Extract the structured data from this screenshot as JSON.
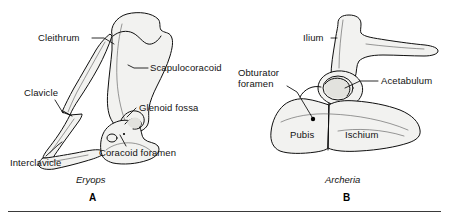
{
  "figure": {
    "ink_color": "#121212",
    "bone_fill": "#f2f2f0",
    "bone_shade": "#e2e2de"
  },
  "panels": [
    {
      "letter": "A",
      "genus": "Eryops",
      "structure": "pectoral girdle",
      "labels": [
        {
          "id": "cleithrum",
          "text": "Cleithrum"
        },
        {
          "id": "scapulocoracoid",
          "text": "Scapulocoracoid"
        },
        {
          "id": "clavicle",
          "text": "Clavicle"
        },
        {
          "id": "glenoid-fossa",
          "text": "Glenoid fossa"
        },
        {
          "id": "coracoid-foramen",
          "text": "Coracoid foramen"
        },
        {
          "id": "interclavicle",
          "text": "Interclavicle"
        }
      ]
    },
    {
      "letter": "B",
      "genus": "Archeria",
      "structure": "pelvic girdle",
      "labels": [
        {
          "id": "ilium",
          "text": "Ilium"
        },
        {
          "id": "obturator-foramen-line1",
          "text": "Obturator"
        },
        {
          "id": "obturator-foramen-line2",
          "text": "foramen"
        },
        {
          "id": "acetabulum",
          "text": "Acetabulum"
        },
        {
          "id": "pubis",
          "text": "Pubis"
        },
        {
          "id": "ischium",
          "text": "Ischium"
        }
      ]
    }
  ]
}
